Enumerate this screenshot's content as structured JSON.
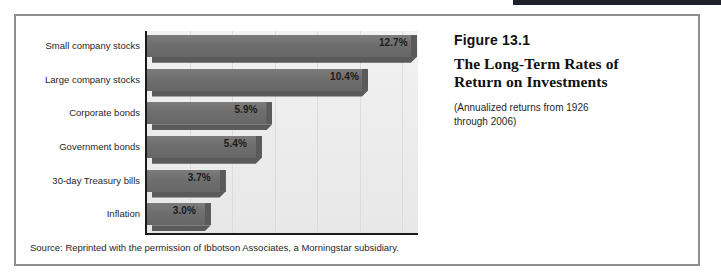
{
  "figure": {
    "number_label": "Figure 13.1",
    "title_line_1": "The Long-Term Rates of",
    "title_line_2": "Return on Investments",
    "subtitle": "(Annualized returns from 1926 through 2006)",
    "source": "Source: Reprinted with the permission of Ibbotson Associates, a Morningstar subsidiary."
  },
  "colors": {
    "bar_fill": "#6e6e6e",
    "bar_shadow": "#5a5a5a",
    "plot_background": "#ececec",
    "gridline": "#dcdcdc",
    "axis": "#1a1a1a",
    "frame_border": "#8e8e90",
    "top_rule": "#20202a",
    "text": "#1f1f1f"
  },
  "chart_data": {
    "type": "bar",
    "orientation": "horizontal",
    "title": "The Long-Term Rates of Return on Investments",
    "subtitle": "(Annualized returns from 1926 through 2006)",
    "xlabel": "",
    "ylabel": "",
    "xlim": [
      0,
      12.75
    ],
    "grid": true,
    "grid_axis": "x",
    "legend": false,
    "value_suffix": "%",
    "categories": [
      "Small company stocks",
      "Large company stocks",
      "Corporate bonds",
      "Government bonds",
      "30-day Treasury bills",
      "Inflation"
    ],
    "values": [
      12.7,
      10.4,
      5.9,
      5.4,
      3.7,
      3.0
    ],
    "labels": [
      "12.7%",
      "10.4%",
      "5.9%",
      "5.4%",
      "3.7%",
      "3.0%"
    ]
  }
}
